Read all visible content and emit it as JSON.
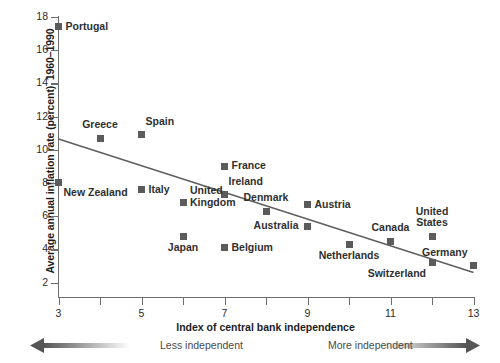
{
  "chart_data": {
    "type": "scatter",
    "title": "",
    "xlabel": "Index of central bank independence",
    "ylabel": "Average annual inflation rate (percent), 1960–1990",
    "xlim": [
      3,
      13
    ],
    "ylim": [
      1,
      18
    ],
    "xticks": [
      3,
      4,
      5,
      6,
      7,
      8,
      9,
      10,
      11,
      12,
      13
    ],
    "xtick_labels": [
      "3",
      "",
      "5",
      "",
      "7",
      "",
      "9",
      "",
      "11",
      "",
      "13"
    ],
    "yticks": [
      2,
      4,
      6,
      8,
      10,
      12,
      14,
      16,
      18
    ],
    "ytick_labels": [
      "2",
      "4",
      "6",
      "8",
      "10",
      "12",
      "14",
      "16",
      "18"
    ],
    "grid": false,
    "legend": "none",
    "points": [
      {
        "label": "Portugal",
        "x": 3,
        "y": 17.4,
        "label_pos": "right"
      },
      {
        "label": "Greece",
        "x": 4,
        "y": 10.7,
        "label_pos": "above"
      },
      {
        "label": "Spain",
        "x": 5,
        "y": 10.9,
        "label_pos": "above-right"
      },
      {
        "label": "New Zealand",
        "x": 3,
        "y": 8.0,
        "label_pos": "below-right"
      },
      {
        "label": "Italy",
        "x": 5,
        "y": 7.6,
        "label_pos": "right"
      },
      {
        "label": "France",
        "x": 7,
        "y": 9.0,
        "label_pos": "right"
      },
      {
        "label": "Ireland",
        "x": 7,
        "y": 7.3,
        "label_pos": "above-right"
      },
      {
        "label": "United\nKingdom",
        "x": 6,
        "y": 6.8,
        "label_pos": "right"
      },
      {
        "label": "Japan",
        "x": 6,
        "y": 4.8,
        "label_pos": "below"
      },
      {
        "label": "Belgium",
        "x": 7,
        "y": 4.1,
        "label_pos": "right"
      },
      {
        "label": "Denmark",
        "x": 8,
        "y": 6.3,
        "label_pos": "above"
      },
      {
        "label": "Austria",
        "x": 9,
        "y": 6.7,
        "label_pos": "right"
      },
      {
        "label": "Australia",
        "x": 9,
        "y": 5.4,
        "label_pos": "left"
      },
      {
        "label": "Netherlands",
        "x": 10,
        "y": 4.3,
        "label_pos": "below"
      },
      {
        "label": "Canada",
        "x": 11,
        "y": 4.5,
        "label_pos": "above"
      },
      {
        "label": "United\nStates",
        "x": 12,
        "y": 4.8,
        "label_pos": "above"
      },
      {
        "label": "Switzerland",
        "x": 12,
        "y": 3.2,
        "label_pos": "below-left"
      },
      {
        "label": "Germany",
        "x": 13,
        "y": 3.0,
        "label_pos": "above-left"
      }
    ],
    "trendline": {
      "x0": 3,
      "y0": 10.65,
      "x1": 13,
      "y1": 2.6
    },
    "annotations": {
      "less_independent": "Less independent",
      "more_independent": "More independent"
    }
  }
}
